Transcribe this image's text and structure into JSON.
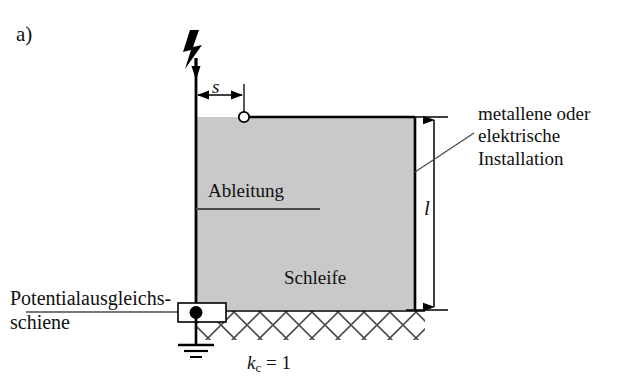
{
  "figure": {
    "panel_label": "a)",
    "width": 638,
    "height": 383,
    "background_color": "#ffffff",
    "loop_fill_color": "#c9c9c9",
    "line_color": "#000000"
  },
  "dimensions": {
    "s_label": "s",
    "l_label": "l"
  },
  "annotations": {
    "down_conductor": "Ableitung",
    "loop": "Schleife",
    "installation_line1": "metallene oder",
    "installation_line2": "elektrische",
    "installation_line3": "Installation",
    "equipotential_line1": "Potentialausgleichs-",
    "equipotential_line2": "schiene",
    "equipotential_full": "Potentialausgleichsschiene"
  },
  "formula": {
    "symbol": "k",
    "subscript": "c",
    "operator": "=",
    "value": "1",
    "full": "kc = 1"
  },
  "symbols": {
    "lightning": "lightning-strike-arrow",
    "node": "open-circle-terminal",
    "busbar": "equipotential-busbar",
    "earth": "earth-ground-symbol",
    "hatching": "soil-hatching"
  }
}
